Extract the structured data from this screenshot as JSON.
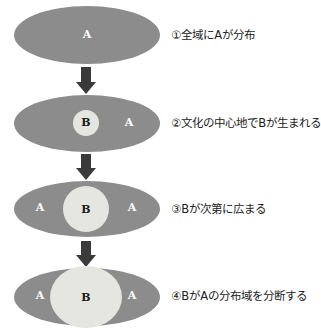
{
  "diagram": {
    "colors": {
      "region_a": "#8c8c8c",
      "region_b": "#e6e6e1",
      "arrow": "#3a3a3a",
      "label_a": "#ffffff",
      "label_b": "#1a1a1a"
    },
    "steps": [
      {
        "number": "①",
        "caption": "①全域にAが分布",
        "labels": {
          "center_a": "A"
        }
      },
      {
        "number": "②",
        "caption": "②文化の中心地でBが生まれる",
        "labels": {
          "b": "B",
          "right_a": "A"
        }
      },
      {
        "number": "③",
        "caption": "③Bが次第に広まる",
        "labels": {
          "left_a": "A",
          "b": "B",
          "right_a": "A"
        }
      },
      {
        "number": "④",
        "caption": "④BがAの分布域を分断する",
        "labels": {
          "left_a": "A",
          "b": "B",
          "right_a": "A"
        }
      }
    ],
    "arrows": 3
  }
}
